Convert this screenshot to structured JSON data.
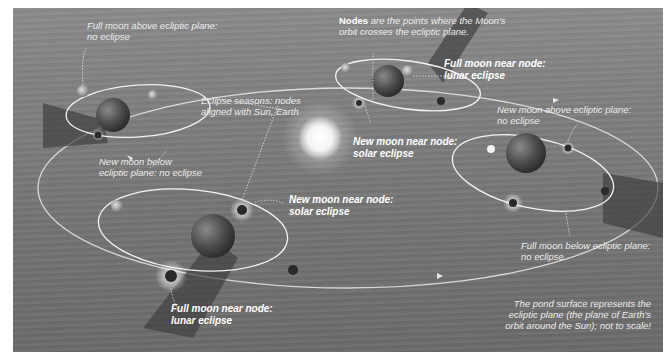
{
  "diagram": {
    "type": "illustration",
    "background": "pond surface (ecliptic plane)",
    "colors": {
      "frame_bg": "#7e7e7e",
      "label_text": "#ececec",
      "orbit_line": "#f2f2f2",
      "leader_line": "#d8d8d8",
      "sun": "#ffffff",
      "shadow": "#3a3a3a"
    }
  },
  "labels": {
    "nodes_bold": "Nodes",
    "nodes_rest_line1": " are the points where the Moon's",
    "nodes_line2": "orbit crosses the ecliptic plane.",
    "full_above_line1": "Full moon above ecliptic plane:",
    "full_above_line2": "no eclipse",
    "eclipse_seasons_line1": "Eclipse seasons: nodes",
    "eclipse_seasons_line2": "aligned with Sun, Earth",
    "new_below_line1": "New moon below",
    "new_below_line2": "ecliptic plane: no eclipse",
    "full_near_top_line1": "Full moon near node:",
    "full_near_top_line2": "lunar eclipse",
    "new_near_top_line1": "New moon near node:",
    "new_near_top_line2": "solar eclipse",
    "new_above_line1": "New moon above ecliptic plane:",
    "new_above_line2": "no eclipse",
    "new_near_bottom_line1": "New moon near node:",
    "new_near_bottom_line2": "solar eclipse",
    "full_below_line1": "Full moon below ecliptic plane:",
    "full_below_line2": "no eclipse",
    "full_near_bottom_line1": "Full moon near node:",
    "full_near_bottom_line2": "lunar eclipse",
    "caption_line1": "The pond surface represents the",
    "caption_line2": "ecliptic plane (the plane of Earth's",
    "caption_line3": "orbit around the Sun); not to scale!"
  }
}
